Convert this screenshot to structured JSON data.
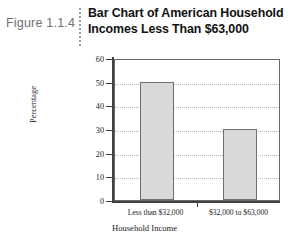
{
  "figure": {
    "label": "Figure 1.1.4",
    "separator_icon": "vertical-dotted-rule-icon"
  },
  "chart_data": {
    "type": "bar",
    "title": "Bar Chart of American Household Incomes Less Than $63,000",
    "title_line1": "Bar Chart of American Household",
    "title_line2": "Incomes Less Than $63,000",
    "categories": [
      "Less than $32,000",
      "$32,000 to $63,000"
    ],
    "values": [
      50,
      30
    ],
    "xlabel": "Household Income",
    "ylabel": "Percentage",
    "ylim": [
      0,
      60
    ],
    "yticks": [
      0,
      10,
      20,
      30,
      40,
      50,
      60
    ],
    "ytick_labels": [
      "0",
      "10",
      "20",
      "30",
      "40",
      "50",
      "60"
    ],
    "grid": true,
    "legend": "none",
    "bar_fill_color": "#d9d9d9",
    "bar_border_color": "#707070",
    "axis_color": "#404040",
    "gridline_color": "#b8b8b8"
  }
}
